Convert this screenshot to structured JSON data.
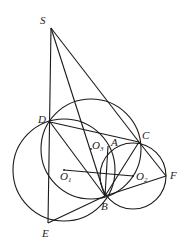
{
  "diagram": {
    "type": "geometry",
    "points": {
      "S": {
        "x": 51,
        "y": 28,
        "label": "S",
        "lx": 40,
        "ly": 24
      },
      "D": {
        "x": 50,
        "y": 122,
        "label": "D",
        "lx": 38,
        "ly": 123
      },
      "E": {
        "x": 48,
        "y": 223,
        "label": "E",
        "lx": 42,
        "ly": 237
      },
      "B": {
        "x": 105,
        "y": 196,
        "label": "B",
        "lx": 101,
        "ly": 210
      },
      "C": {
        "x": 139,
        "y": 142,
        "label": "C",
        "lx": 142,
        "ly": 139
      },
      "F": {
        "x": 166,
        "y": 176,
        "label": "F",
        "lx": 170,
        "ly": 179
      },
      "A": {
        "x": 108,
        "y": 146,
        "label": "A",
        "lx": 111,
        "ly": 146
      },
      "O1": {
        "x": 64,
        "y": 170,
        "label": "O",
        "sub": "1",
        "lx": 60,
        "ly": 180
      },
      "O2": {
        "x": 133,
        "y": 176,
        "label": "O",
        "sub": "2",
        "lx": 136,
        "ly": 180
      },
      "O3": {
        "x": 91,
        "y": 149,
        "label": "O",
        "sub": "3",
        "lx": 92,
        "ly": 149
      }
    },
    "circles": [
      {
        "name": "circle-o1",
        "cx": 64,
        "cy": 170,
        "r": 51
      },
      {
        "name": "circle-o3",
        "cx": 91,
        "cy": 149,
        "r": 50
      },
      {
        "name": "circle-o2",
        "cx": 133,
        "cy": 176,
        "r": 33
      }
    ],
    "segments": [
      [
        "S",
        "E"
      ],
      [
        "S",
        "C"
      ],
      [
        "S",
        "B"
      ],
      [
        "D",
        "B"
      ],
      [
        "D",
        "C"
      ],
      [
        "E",
        "B"
      ],
      [
        "B",
        "F"
      ],
      [
        "C",
        "F"
      ],
      [
        "B",
        "C"
      ],
      [
        "O1",
        "O2"
      ],
      [
        "A",
        "B"
      ]
    ]
  }
}
